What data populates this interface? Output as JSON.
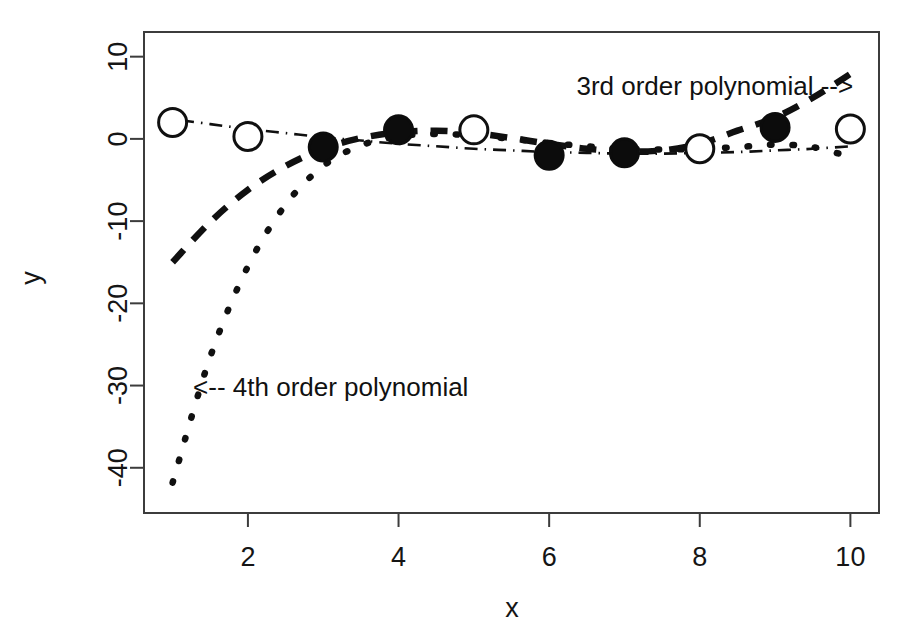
{
  "chart_data": {
    "type": "line",
    "title": "",
    "xlabel": "x",
    "ylabel": "y",
    "xlim": [
      0.62,
      10.38
    ],
    "ylim": [
      -45.5,
      13.0
    ],
    "xticks": [
      2,
      4,
      6,
      8,
      10
    ],
    "xtick_labels": [
      "2",
      "4",
      "6",
      "8",
      "10"
    ],
    "yticks": [
      10,
      0,
      -10,
      -20,
      -30,
      -40
    ],
    "ytick_labels": [
      "10",
      "0",
      "-10",
      "-20",
      "-30",
      "-40"
    ],
    "grid": false,
    "legend_position": "none",
    "box": true,
    "series": [
      {
        "name": "observed points (open circles)",
        "marker": "open-circle",
        "linestyle": "none",
        "x": [
          1,
          2,
          5,
          8,
          10
        ],
        "y": [
          2.0,
          0.3,
          1.1,
          -1.2,
          1.2
        ]
      },
      {
        "name": "fitted points (filled circles)",
        "marker": "filled-circle",
        "linestyle": "none",
        "x": [
          3,
          4,
          6,
          7,
          9
        ],
        "y": [
          -1.0,
          1.1,
          -2.0,
          -1.7,
          1.4
        ]
      },
      {
        "name": "3rd order polynomial",
        "marker": "none",
        "linestyle": "dashed",
        "x": [
          1.0,
          1.5,
          2.0,
          2.5,
          3.0,
          3.5,
          4.0,
          4.5,
          5.0,
          5.5,
          6.0,
          6.5,
          7.0,
          7.5,
          8.0,
          8.5,
          9.0,
          9.5,
          10.0
        ],
        "y": [
          -15.0,
          -10.1,
          -6.2,
          -3.3,
          -1.2,
          0.1,
          0.8,
          1.0,
          0.7,
          0.1,
          -0.6,
          -1.2,
          -1.5,
          -1.4,
          -0.6,
          1.0,
          2.6,
          5.0,
          7.9
        ]
      },
      {
        "name": "4th order polynomial",
        "marker": "none",
        "linestyle": "dotted",
        "x": [
          1.0,
          1.5,
          2.0,
          2.5,
          3.0,
          3.5,
          4.0,
          4.5,
          5.0,
          5.5,
          6.0,
          6.5,
          7.0,
          7.5,
          8.0,
          8.5,
          9.0,
          9.5,
          10.0
        ],
        "y": [
          -41.8,
          -26.5,
          -15.5,
          -8.0,
          -3.3,
          -0.8,
          0.3,
          0.6,
          0.4,
          0.0,
          -0.5,
          -0.9,
          -1.2,
          -1.3,
          -1.2,
          -1.0,
          -0.7,
          -1.0,
          -2.2
        ]
      },
      {
        "name": "smooth dot-dash trend",
        "marker": "none",
        "linestyle": "dotdash",
        "x": [
          1.0,
          1.5,
          2.0,
          2.5,
          3.0,
          3.5,
          4.0,
          4.5,
          5.0,
          5.5,
          6.0,
          6.5,
          7.0,
          7.5,
          8.0,
          8.5,
          9.0,
          9.5,
          10.0
        ],
        "y": [
          2.4,
          1.8,
          1.2,
          0.7,
          0.2,
          -0.2,
          -0.6,
          -0.9,
          -1.2,
          -1.4,
          -1.6,
          -1.7,
          -1.8,
          -1.8,
          -1.7,
          -1.6,
          -1.4,
          -1.2,
          -0.9
        ]
      }
    ],
    "annotations": [
      {
        "id": "annotation-3rd-order",
        "text": "3rd order polynomial -->",
        "x": 8.2,
        "y": 6.4,
        "anchor": "middle"
      },
      {
        "id": "annotation-4th-order",
        "text": "<-- 4th order polynomial",
        "x": 3.1,
        "y": -30.2,
        "anchor": "middle"
      }
    ],
    "colors": {
      "line": "#101010",
      "axis": "#3c3c3c",
      "text": "#151515",
      "background": "#ffffff",
      "marker_fill_open": "#ffffff",
      "marker_fill_closed": "#0c0c0c"
    }
  }
}
